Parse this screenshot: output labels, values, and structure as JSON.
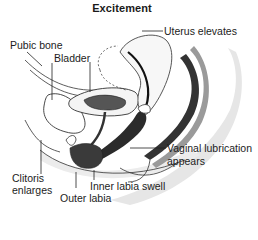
{
  "title": "Excitement",
  "labels": {
    "uterus": "Uterus elevates",
    "pubic_bone": "Pubic bone",
    "bladder": "Bladder",
    "vaginal_line1": "Vaginal lubrication",
    "vaginal_line2": "appears",
    "clitoris_line1": "Clitoris",
    "clitoris_line2": "enlarges",
    "inner_labia": "Inner labia swell",
    "outer_labia": "Outer labia"
  },
  "colors": {
    "ink": "#1a1a1a",
    "tissue_dark": "#2a2a2a",
    "tissue_mid": "#6a6a6a",
    "shade": "#e2e2e2"
  }
}
